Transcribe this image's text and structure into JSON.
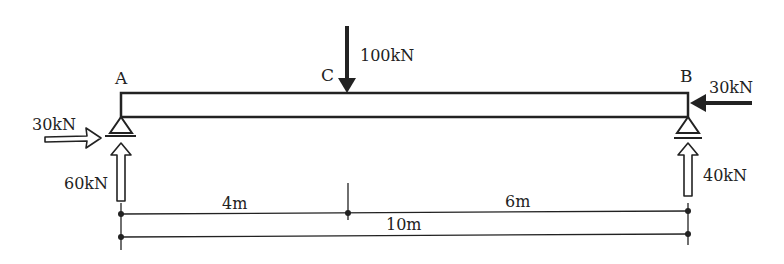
{
  "diagram": {
    "type": "simply-supported-beam",
    "points": {
      "A": "A",
      "B": "B",
      "C": "C"
    },
    "loads": {
      "point_load_c": {
        "label": "100kN",
        "direction": "down"
      },
      "horizontal_load_b": {
        "label": "30kN",
        "direction": "left"
      }
    },
    "reactions": {
      "a_horizontal": {
        "label": "30kN",
        "direction": "right"
      },
      "a_vertical": {
        "label": "60kN",
        "direction": "up"
      },
      "b_vertical": {
        "label": "40kN",
        "direction": "up"
      }
    },
    "dimensions": {
      "a_to_c": "4m",
      "c_to_b": "6m",
      "total": "10m"
    },
    "colors": {
      "ink": "#222222",
      "background": "#ffffff"
    }
  }
}
